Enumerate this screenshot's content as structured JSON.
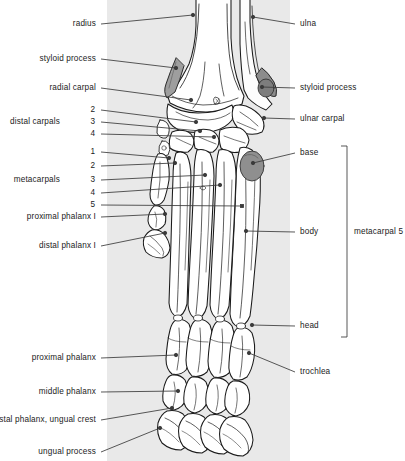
{
  "figure": {
    "band_color": "#e9e9e9",
    "line_color": "#3a3a3a",
    "bone_fill": "#ffffff",
    "shade_color": "#9a9a9a",
    "shade_light": "#c2c2c2"
  },
  "labels_left": [
    {
      "text": "radius",
      "x": 96,
      "y": 24,
      "dot_x": 193,
      "dot_y": 15
    },
    {
      "text": "styloid process",
      "x": 96,
      "y": 59,
      "dot_x": 176,
      "dot_y": 68
    },
    {
      "text": "radial carpal",
      "x": 96,
      "y": 88,
      "dot_x": 191,
      "dot_y": 100
    },
    {
      "text": "distal carpals",
      "x": 60,
      "y": 122,
      "dot_x": null,
      "dot_y": null
    },
    {
      "text": "metacarpals",
      "x": 60,
      "y": 180,
      "dot_x": null,
      "dot_y": null
    },
    {
      "text": "proximal phalanx I",
      "x": 96,
      "y": 217,
      "dot_x": 165,
      "dot_y": 214
    },
    {
      "text": "distal phalanx I",
      "x": 96,
      "y": 246,
      "dot_x": 165,
      "dot_y": 233
    },
    {
      "text": "proximal phalanx",
      "x": 96,
      "y": 358,
      "dot_x": 176,
      "dot_y": 355
    },
    {
      "text": "middle phalanx",
      "x": 96,
      "y": 392,
      "dot_x": 178,
      "dot_y": 391
    },
    {
      "text": "distal phalanx, ungual crest",
      "x": 96,
      "y": 420,
      "dot_x": 172,
      "dot_y": 408
    },
    {
      "text": "ungual process",
      "x": 96,
      "y": 452,
      "dot_x": 160,
      "dot_y": 428
    }
  ],
  "numbers_distal_carpals": [
    {
      "text": "2",
      "x": 95,
      "y": 110,
      "dot_x": 196,
      "dot_y": 122
    },
    {
      "text": "3",
      "x": 95,
      "y": 122,
      "dot_x": 200,
      "dot_y": 131
    },
    {
      "text": "4",
      "x": 95,
      "y": 134,
      "dot_x": 214,
      "dot_y": 137
    }
  ],
  "numbers_metacarpals": [
    {
      "text": "1",
      "x": 95,
      "y": 152,
      "dot_x": 169,
      "dot_y": 158
    },
    {
      "text": "2",
      "x": 95,
      "y": 166,
      "dot_x": 175,
      "dot_y": 163
    },
    {
      "text": "3",
      "x": 95,
      "y": 180,
      "dot_x": 205,
      "dot_y": 175
    },
    {
      "text": "4",
      "x": 95,
      "y": 193,
      "dot_x": 220,
      "dot_y": 185
    },
    {
      "text": "5",
      "x": 95,
      "y": 205,
      "dot_x": 242,
      "dot_y": 206
    }
  ],
  "labels_right": [
    {
      "text": "ulna",
      "x": 300,
      "y": 24,
      "dot_x": 253,
      "dot_y": 17
    },
    {
      "text": "styloid process",
      "x": 300,
      "y": 88,
      "dot_x": 262,
      "dot_y": 87
    },
    {
      "text": "ulnar carpal",
      "x": 300,
      "y": 119,
      "dot_x": 264,
      "dot_y": 118
    },
    {
      "text": "base",
      "x": 300,
      "y": 153,
      "dot_x": 253,
      "dot_y": 163
    },
    {
      "text": "body",
      "x": 300,
      "y": 232,
      "dot_x": 246,
      "dot_y": 231
    },
    {
      "text": "head",
      "x": 300,
      "y": 326,
      "dot_x": 252,
      "dot_y": 325
    },
    {
      "text": "trochlea",
      "x": 300,
      "y": 372,
      "dot_x": 249,
      "dot_y": 353
    }
  ],
  "bracket": {
    "label": "metacarpal 5",
    "label_x": 354,
    "label_y": 232,
    "line_x": 347,
    "top_y": 146,
    "bottom_y": 337,
    "tick": 6
  }
}
